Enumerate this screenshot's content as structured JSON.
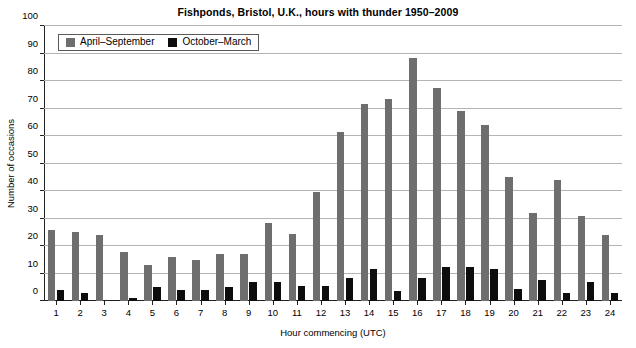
{
  "chart_data": {
    "type": "bar",
    "title": "Fishponds, Bristol, U.K., hours with thunder 1950–2009",
    "xlabel": "Hour commencing (UTC)",
    "ylabel": "Number of occasions",
    "ylim": [
      0,
      100
    ],
    "ytick_step": 10,
    "yticks": [
      0,
      10,
      20,
      30,
      40,
      50,
      60,
      70,
      80,
      90,
      100
    ],
    "grid": true,
    "legend_position": "top-left",
    "categories": [
      "1",
      "2",
      "3",
      "4",
      "5",
      "6",
      "7",
      "8",
      "9",
      "10",
      "11",
      "12",
      "13",
      "14",
      "15",
      "16",
      "17",
      "18",
      "19",
      "20",
      "21",
      "22",
      "23",
      "24"
    ],
    "series": [
      {
        "name": "April–September",
        "color": "#6e6e6e",
        "values": [
          26,
          25,
          24,
          18,
          13,
          16,
          15,
          17,
          17,
          28.5,
          24.5,
          39.5,
          61.5,
          71.5,
          73.5,
          88.5,
          77.5,
          69,
          64,
          45,
          32,
          44,
          31,
          24
        ]
      },
      {
        "name": "October–March",
        "color": "#0d0d0d",
        "values": [
          4,
          3,
          0,
          1,
          5,
          4,
          4,
          5,
          7,
          7,
          5.5,
          5.5,
          8.5,
          11.5,
          3.5,
          8.5,
          12.5,
          12.5,
          11.5,
          4.5,
          7.5,
          3,
          7,
          3
        ]
      }
    ]
  }
}
